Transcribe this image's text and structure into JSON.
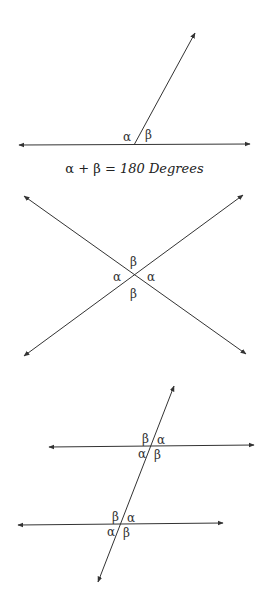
{
  "diagram1": {
    "labels": {
      "alpha": "α",
      "beta": "β"
    },
    "caption": {
      "lhs": "α + β = ",
      "rhs": "180 Degrees"
    }
  },
  "diagram2": {
    "labels": {
      "top": "β",
      "left": "α",
      "right": "α",
      "bottom": "β"
    }
  },
  "diagram3": {
    "upper": {
      "tl": "β",
      "tr": "α",
      "bl": "α",
      "br": "β"
    },
    "lower": {
      "tl": "β",
      "tr": "α",
      "bl": "α",
      "br": "β"
    }
  },
  "colors": {
    "line": "#333333",
    "background": "#ffffff"
  }
}
